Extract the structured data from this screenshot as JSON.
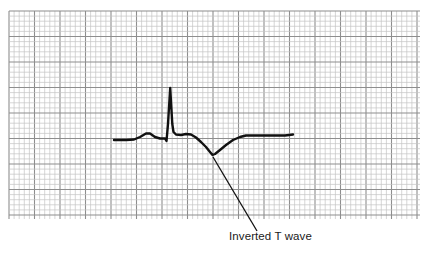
{
  "figure": {
    "grid": {
      "x0": 9,
      "y0": 11,
      "x1": 420,
      "y1": 219,
      "minor_px": 5.1,
      "major_every": 5,
      "minor_color": "#c4c4c4",
      "major_color": "#8e8e8e"
    },
    "trace": {
      "color": "#111111",
      "width": 2.4,
      "points": [
        [
          114,
          140
        ],
        [
          126,
          140
        ],
        [
          134,
          139.5
        ],
        [
          140,
          137
        ],
        [
          146,
          133.5
        ],
        [
          150,
          133.5
        ],
        [
          155,
          137
        ],
        [
          160,
          138.5
        ],
        [
          165,
          138.5
        ],
        [
          166.5,
          141
        ],
        [
          168,
          124
        ],
        [
          170.2,
          88
        ],
        [
          172.3,
          124
        ],
        [
          173.5,
          132
        ],
        [
          176,
          134.5
        ],
        [
          181,
          135
        ],
        [
          186,
          134
        ],
        [
          191,
          134.5
        ],
        [
          196,
          137.5
        ],
        [
          201,
          142
        ],
        [
          206,
          147
        ],
        [
          210,
          152
        ],
        [
          212.5,
          155
        ],
        [
          215,
          154
        ],
        [
          220,
          150
        ],
        [
          226,
          145
        ],
        [
          233,
          140
        ],
        [
          240,
          137
        ],
        [
          246,
          135.5
        ],
        [
          260,
          135.5
        ],
        [
          275,
          135.5
        ],
        [
          285,
          135.5
        ],
        [
          293,
          134.5
        ]
      ]
    },
    "annotation": {
      "label": "Inverted T wave",
      "leader_from": [
        213,
        157
      ],
      "leader_to": [
        257,
        231
      ]
    }
  }
}
